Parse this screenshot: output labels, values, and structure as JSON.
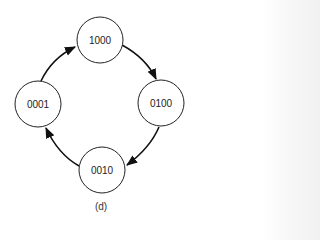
{
  "diagram": {
    "type": "state-cycle",
    "caption": "(d)",
    "nodes": [
      {
        "id": "n1000",
        "label": "1000",
        "position": "top"
      },
      {
        "id": "n0100",
        "label": "0100",
        "position": "right"
      },
      {
        "id": "n0010",
        "label": "0010",
        "position": "bottom"
      },
      {
        "id": "n0001",
        "label": "0001",
        "position": "left"
      }
    ],
    "edges": [
      {
        "from": "1000",
        "to": "0100",
        "direction": "clockwise"
      },
      {
        "from": "0100",
        "to": "0010",
        "direction": "clockwise"
      },
      {
        "from": "0010",
        "to": "0001",
        "direction": "clockwise"
      },
      {
        "from": "0001",
        "to": "1000",
        "direction": "clockwise"
      }
    ],
    "colors": {
      "stroke": "#222222",
      "fill": "#ffffff"
    }
  }
}
